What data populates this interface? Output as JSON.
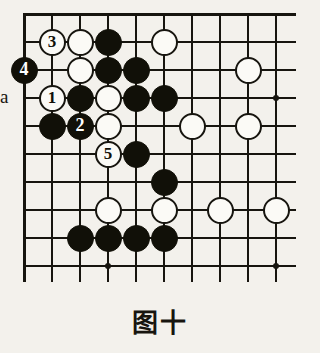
{
  "figure": {
    "caption": "图十",
    "kind": "go-board-diagram",
    "colors": {
      "background": "#f3f1ec",
      "line": "#17150f",
      "black_stone": "#111008",
      "white_stone": "#fbfaf6"
    }
  },
  "board": {
    "columns": 10,
    "rows": 10,
    "origin_x": 24,
    "origin_y": 14,
    "spacing_x": 28,
    "spacing_y": 28,
    "star_points": [
      {
        "col": 4,
        "row": 10
      },
      {
        "col": 10,
        "row": 4
      },
      {
        "col": 10,
        "row": 10
      }
    ]
  },
  "labels": [
    {
      "name": "point-label-a",
      "text": "a",
      "col": 0,
      "row": 4
    }
  ],
  "stones": [
    {
      "color": "white",
      "col": 2,
      "row": 2,
      "number": "3"
    },
    {
      "color": "white",
      "col": 3,
      "row": 2,
      "number": ""
    },
    {
      "color": "black",
      "col": 4,
      "row": 2,
      "number": ""
    },
    {
      "color": "white",
      "col": 6,
      "row": 2,
      "number": ""
    },
    {
      "color": "black",
      "col": 1,
      "row": 3,
      "number": "4"
    },
    {
      "color": "white",
      "col": 3,
      "row": 3,
      "number": ""
    },
    {
      "color": "black",
      "col": 4,
      "row": 3,
      "number": ""
    },
    {
      "color": "black",
      "col": 5,
      "row": 3,
      "number": ""
    },
    {
      "color": "white",
      "col": 9,
      "row": 3,
      "number": ""
    },
    {
      "color": "white",
      "col": 2,
      "row": 4,
      "number": "1"
    },
    {
      "color": "black",
      "col": 3,
      "row": 4,
      "number": ""
    },
    {
      "color": "white",
      "col": 4,
      "row": 4,
      "number": ""
    },
    {
      "color": "black",
      "col": 5,
      "row": 4,
      "number": ""
    },
    {
      "color": "black",
      "col": 6,
      "row": 4,
      "number": ""
    },
    {
      "color": "black",
      "col": 2,
      "row": 5,
      "number": ""
    },
    {
      "color": "black",
      "col": 3,
      "row": 5,
      "number": "2"
    },
    {
      "color": "white",
      "col": 4,
      "row": 5,
      "number": ""
    },
    {
      "color": "white",
      "col": 7,
      "row": 5,
      "number": ""
    },
    {
      "color": "white",
      "col": 9,
      "row": 5,
      "number": ""
    },
    {
      "color": "white",
      "col": 4,
      "row": 6,
      "number": "5"
    },
    {
      "color": "black",
      "col": 5,
      "row": 6,
      "number": ""
    },
    {
      "color": "black",
      "col": 6,
      "row": 7,
      "number": ""
    },
    {
      "color": "white",
      "col": 4,
      "row": 8,
      "number": ""
    },
    {
      "color": "white",
      "col": 6,
      "row": 8,
      "number": ""
    },
    {
      "color": "white",
      "col": 8,
      "row": 8,
      "number": ""
    },
    {
      "color": "white",
      "col": 10,
      "row": 8,
      "number": ""
    },
    {
      "color": "black",
      "col": 3,
      "row": 9,
      "number": ""
    },
    {
      "color": "black",
      "col": 4,
      "row": 9,
      "number": ""
    },
    {
      "color": "black",
      "col": 5,
      "row": 9,
      "number": ""
    },
    {
      "color": "black",
      "col": 6,
      "row": 9,
      "number": ""
    }
  ]
}
